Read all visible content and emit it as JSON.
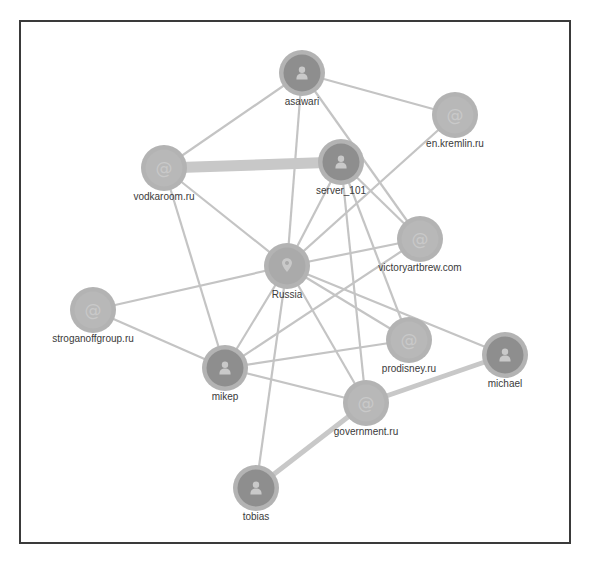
{
  "colors": {
    "edge": "#c4c4c4",
    "edge_strong": "#c8c8c8",
    "node_ring": "#b3b3b3",
    "node_person_fill": "#8e8e8e",
    "node_domain_fill": "#b8b8b8",
    "node_location_fill": "#aaaaaa",
    "icon": "#c9c9c9",
    "label": "#3a3a3a",
    "frame": "#3a3a3a"
  },
  "graph": {
    "nodes": [
      {
        "id": "asawari",
        "label": "asawari",
        "type": "person",
        "icon": "person-icon",
        "x": 302,
        "y": 73
      },
      {
        "id": "en.kremlin.ru",
        "label": "en.kremlin.ru",
        "type": "domain",
        "icon": "at-icon",
        "x": 455,
        "y": 115
      },
      {
        "id": "vodkaroom.ru",
        "label": "vodkaroom.ru",
        "type": "domain",
        "icon": "at-icon",
        "x": 164,
        "y": 168
      },
      {
        "id": "server_101",
        "label": "server_101",
        "type": "person",
        "icon": "person-icon",
        "x": 341,
        "y": 162
      },
      {
        "id": "victoryartbrew.com",
        "label": "victoryartbrew.com",
        "type": "domain",
        "icon": "at-icon",
        "x": 420,
        "y": 239
      },
      {
        "id": "Russia",
        "label": "Russia",
        "type": "location",
        "icon": "map-pin-icon",
        "x": 287,
        "y": 266
      },
      {
        "id": "stroganoffgroup.ru",
        "label": "stroganoffgroup.ru",
        "type": "domain",
        "icon": "at-icon",
        "x": 93,
        "y": 310
      },
      {
        "id": "mikep",
        "label": "mikep",
        "type": "person",
        "icon": "person-icon",
        "x": 225,
        "y": 368
      },
      {
        "id": "prodisney.ru",
        "label": "prodisney.ru",
        "type": "domain",
        "icon": "at-icon",
        "x": 409,
        "y": 340
      },
      {
        "id": "michael",
        "label": "michael",
        "type": "person",
        "icon": "person-icon",
        "x": 505,
        "y": 355
      },
      {
        "id": "government.ru",
        "label": "government.ru",
        "type": "domain",
        "icon": "at-icon",
        "x": 366,
        "y": 403
      },
      {
        "id": "tobias",
        "label": "tobias",
        "type": "person",
        "icon": "person-icon",
        "x": 256,
        "y": 488
      }
    ],
    "edges": [
      {
        "source": "asawari",
        "target": "vodkaroom.ru",
        "weight": 1
      },
      {
        "source": "asawari",
        "target": "en.kremlin.ru",
        "weight": 1
      },
      {
        "source": "asawari",
        "target": "Russia",
        "weight": 1
      },
      {
        "source": "asawari",
        "target": "victoryartbrew.com",
        "weight": 1
      },
      {
        "source": "vodkaroom.ru",
        "target": "server_101",
        "weight": 5
      },
      {
        "source": "vodkaroom.ru",
        "target": "Russia",
        "weight": 1
      },
      {
        "source": "vodkaroom.ru",
        "target": "mikep",
        "weight": 1
      },
      {
        "source": "en.kremlin.ru",
        "target": "Russia",
        "weight": 1
      },
      {
        "source": "server_101",
        "target": "Russia",
        "weight": 1
      },
      {
        "source": "server_101",
        "target": "victoryartbrew.com",
        "weight": 1
      },
      {
        "source": "server_101",
        "target": "prodisney.ru",
        "weight": 1
      },
      {
        "source": "server_101",
        "target": "government.ru",
        "weight": 1
      },
      {
        "source": "Russia",
        "target": "victoryartbrew.com",
        "weight": 1
      },
      {
        "source": "Russia",
        "target": "stroganoffgroup.ru",
        "weight": 1
      },
      {
        "source": "Russia",
        "target": "mikep",
        "weight": 1
      },
      {
        "source": "Russia",
        "target": "prodisney.ru",
        "weight": 1
      },
      {
        "source": "Russia",
        "target": "michael",
        "weight": 1
      },
      {
        "source": "Russia",
        "target": "government.ru",
        "weight": 1
      },
      {
        "source": "Russia",
        "target": "tobias",
        "weight": 1
      },
      {
        "source": "victoryartbrew.com",
        "target": "mikep",
        "weight": 1
      },
      {
        "source": "stroganoffgroup.ru",
        "target": "mikep",
        "weight": 1
      },
      {
        "source": "mikep",
        "target": "prodisney.ru",
        "weight": 1
      },
      {
        "source": "mikep",
        "target": "government.ru",
        "weight": 1
      },
      {
        "source": "government.ru",
        "target": "michael",
        "weight": 2
      },
      {
        "source": "government.ru",
        "target": "tobias",
        "weight": 2
      }
    ]
  }
}
